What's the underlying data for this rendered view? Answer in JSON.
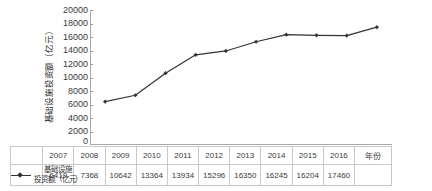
{
  "chart_data": {
    "type": "line",
    "title": "",
    "xlabel": "年份",
    "ylabel": "基础设施投资额（亿元）",
    "categories": [
      "2007",
      "2008",
      "2009",
      "2010",
      "2011",
      "2012",
      "2013",
      "2014",
      "2015",
      "2016"
    ],
    "series": [
      {
        "name": "基础设施投资额（亿元）",
        "values": [
          6419,
          7368,
          10642,
          13364,
          13934,
          15296,
          16350,
          16245,
          16204,
          17460
        ]
      }
    ],
    "ylim": [
      0,
      20000
    ],
    "yticks": [
      0,
      2000,
      4000,
      6000,
      8000,
      10000,
      12000,
      14000,
      16000,
      18000,
      20000
    ],
    "ytick_labels": [
      "0",
      "2000",
      "4000",
      "6000",
      "8000",
      "10000",
      "12000",
      "14000",
      "16000",
      "18000",
      "20000"
    ],
    "grid": false,
    "legend_position": "table-left",
    "line_color": "#333333",
    "marker": "diamond",
    "marker_color": "#333333"
  },
  "axes": {
    "y_title": "基础设施投资额（亿元）",
    "x_title": "年份",
    "zero_label": "0"
  },
  "legend": {
    "label_line1": "基础设施",
    "label_line2": "投资额（亿元）",
    "marker_name": "line-with-diamond-marker"
  },
  "table": {
    "year_row": [
      "2007",
      "2008",
      "2009",
      "2010",
      "2011",
      "2012",
      "2013",
      "2014",
      "2015",
      "2016"
    ],
    "value_row": [
      "6419",
      "7368",
      "10642",
      "13364",
      "13934",
      "15296",
      "16350",
      "16245",
      "16204",
      "17460"
    ],
    "axis_name": "年份"
  }
}
